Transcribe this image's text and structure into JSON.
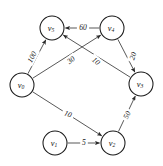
{
  "figure": {
    "name": "weighted-directed-graph",
    "background_color": "#ffffff",
    "stroke_color": "#1a1a1a",
    "edge_color": "#3a3a3a",
    "text_color": "#111111"
  },
  "chart_data": {
    "type": "diagram",
    "diagram_type": "weighted-directed-graph",
    "title": "",
    "xlabel": "",
    "ylabel": "",
    "directed": true,
    "node_count": 6,
    "edge_count": 7,
    "nodes": [
      {
        "id": "v0",
        "label": "v",
        "sub": "0",
        "cx": 22,
        "cy": 85,
        "r": 12
      },
      {
        "id": "v1",
        "label": "v",
        "sub": "1",
        "cx": 55,
        "cy": 143,
        "r": 12
      },
      {
        "id": "v2",
        "label": "v",
        "sub": "2",
        "cx": 113,
        "cy": 143,
        "r": 12
      },
      {
        "id": "v3",
        "label": "v",
        "sub": "3",
        "cx": 141,
        "cy": 84,
        "r": 12
      },
      {
        "id": "v4",
        "label": "v",
        "sub": "4",
        "cx": 112,
        "cy": 28,
        "r": 12
      },
      {
        "id": "v5",
        "label": "v",
        "sub": "5",
        "cx": 52,
        "cy": 28,
        "r": 12
      }
    ],
    "edges": [
      {
        "id": "e-v0-v5",
        "from": "v0",
        "to": "v5",
        "weight": 100,
        "label_x": 32,
        "label_y": 57,
        "label_rotate": -62
      },
      {
        "id": "e-v0-v4",
        "from": "v0",
        "to": "v4",
        "weight": 30,
        "label_x": 71,
        "label_y": 60,
        "label_rotate": -38
      },
      {
        "id": "e-v3-v5",
        "from": "v3",
        "to": "v5",
        "weight": 10,
        "label_x": 96,
        "label_y": 61,
        "label_rotate": 40
      },
      {
        "id": "e-v4-v5",
        "from": "v4",
        "to": "v5",
        "weight": 60,
        "label_x": 83,
        "label_y": 27,
        "label_rotate": 0
      },
      {
        "id": "e-v4-v3",
        "from": "v4",
        "to": "v3",
        "weight": 20,
        "label_x": 133,
        "label_y": 56,
        "label_rotate": -70
      },
      {
        "id": "e-v0-v2",
        "from": "v0",
        "to": "v2",
        "weight": 10,
        "label_x": 68,
        "label_y": 114,
        "label_rotate": 22
      },
      {
        "id": "e-v2-v3",
        "from": "v2",
        "to": "v3",
        "weight": 50,
        "label_x": 127,
        "label_y": 115,
        "label_rotate": -64
      },
      {
        "id": "e-v1-v2",
        "from": "v1",
        "to": "v2",
        "weight": 5,
        "label_x": 84,
        "label_y": 142,
        "label_rotate": 0
      }
    ]
  }
}
